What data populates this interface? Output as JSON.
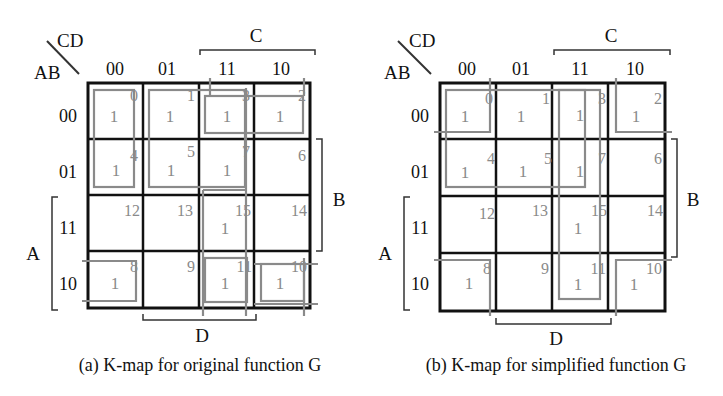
{
  "maps": [
    {
      "id": "a",
      "caption": "(a) K-map for original function G",
      "col_var": "CD",
      "row_var": "AB",
      "col_labels": [
        "00",
        "01",
        "11",
        "10"
      ],
      "row_labels": [
        "00",
        "01",
        "11",
        "10"
      ],
      "bracket_labels": {
        "C": "C",
        "B": "B",
        "A": "A",
        "D": "D"
      },
      "cells": [
        [
          {
            "index": "0",
            "value": "1"
          },
          {
            "index": "1",
            "value": "1"
          },
          {
            "index": "3",
            "value": "1"
          },
          {
            "index": "2",
            "value": "1"
          }
        ],
        [
          {
            "index": "4",
            "value": "1"
          },
          {
            "index": "5",
            "value": "1"
          },
          {
            "index": "7",
            "value": "1"
          },
          {
            "index": "6",
            "value": ""
          }
        ],
        [
          {
            "index": "12",
            "value": ""
          },
          {
            "index": "13",
            "value": ""
          },
          {
            "index": "15",
            "value": "1"
          },
          {
            "index": "14",
            "value": ""
          }
        ],
        [
          {
            "index": "8",
            "value": "1"
          },
          {
            "index": "9",
            "value": ""
          },
          {
            "index": "11",
            "value": "1"
          },
          {
            "index": "10",
            "value": "1"
          }
        ]
      ]
    },
    {
      "id": "b",
      "caption": "(b) K-map for simplified function G",
      "col_var": "CD",
      "row_var": "AB",
      "col_labels": [
        "00",
        "01",
        "11",
        "10"
      ],
      "row_labels": [
        "00",
        "01",
        "11",
        "10"
      ],
      "bracket_labels": {
        "C": "C",
        "B": "B",
        "A": "A",
        "D": "D"
      },
      "cells": [
        [
          {
            "index": "0",
            "value": "1"
          },
          {
            "index": "1",
            "value": "1"
          },
          {
            "index": "3",
            "value": "1"
          },
          {
            "index": "2",
            "value": "1"
          }
        ],
        [
          {
            "index": "4",
            "value": "1"
          },
          {
            "index": "5",
            "value": "1"
          },
          {
            "index": "7",
            "value": "1"
          },
          {
            "index": "6",
            "value": ""
          }
        ],
        [
          {
            "index": "12",
            "value": ""
          },
          {
            "index": "13",
            "value": ""
          },
          {
            "index": "15",
            "value": "1"
          },
          {
            "index": "14",
            "value": ""
          }
        ],
        [
          {
            "index": "8",
            "value": "1"
          },
          {
            "index": "9",
            "value": ""
          },
          {
            "index": "11",
            "value": "1"
          },
          {
            "index": "10",
            "value": "1"
          }
        ]
      ]
    }
  ],
  "colors": {
    "grid": "#111111",
    "group": "#8a8a8a",
    "text": "#111111",
    "index": "#8a8a8a"
  }
}
